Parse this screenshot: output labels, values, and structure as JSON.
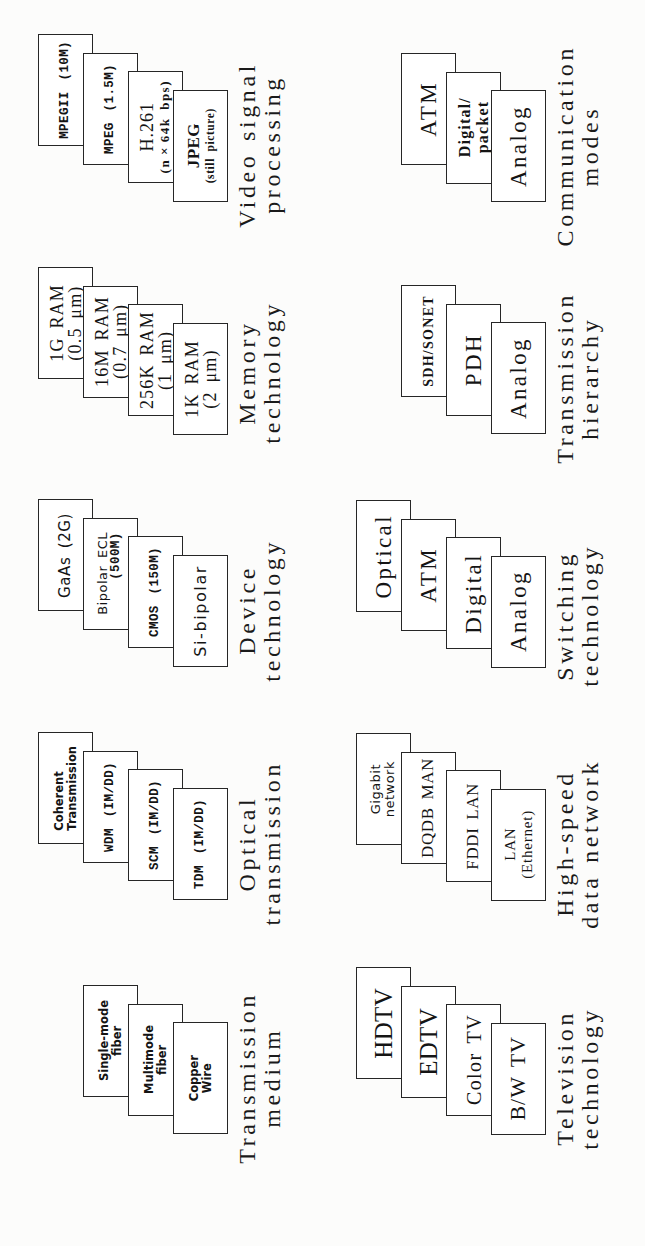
{
  "diagram": {
    "groups": [
      {
        "title": [
          "Transmission",
          "medium"
        ],
        "items": [
          [
            "Copper",
            "Wire"
          ],
          [
            "Multimode",
            "fiber"
          ],
          [
            "Single-mode",
            "fiber"
          ]
        ]
      },
      {
        "title": [
          "Optical",
          "transmission"
        ],
        "items": [
          [
            "TDM (IM/DD)"
          ],
          [
            "SCM (IM/DD)"
          ],
          [
            "WDM (IM/DD)"
          ],
          [
            "Coherent",
            "Transmission"
          ]
        ]
      },
      {
        "title": [
          "Device",
          "technology"
        ],
        "items": [
          [
            "Si-bipolar"
          ],
          [
            "CMOS (150M)"
          ],
          [
            "Bipolar ECL",
            "(500M)"
          ],
          [
            "GaAs (2G)"
          ]
        ]
      },
      {
        "title": [
          "Memory",
          "technology"
        ],
        "items": [
          [
            "1K RAM",
            "(2 μm)"
          ],
          [
            "256K RAM",
            "(1 μm)"
          ],
          [
            "16M RAM",
            "(0.7 μm)"
          ],
          [
            "1G RAM",
            "(0.5 μm)"
          ]
        ]
      },
      {
        "title": [
          "Video signal",
          "processing"
        ],
        "items": [
          [
            "JPEG",
            "(still picture)"
          ],
          [
            "H.261",
            "(n×64k bps)"
          ],
          [
            "MPEG (1.5M)"
          ],
          [
            "MPEGII (10M)"
          ]
        ]
      },
      {
        "title": [
          "Television",
          "technology"
        ],
        "items": [
          [
            "B/W TV"
          ],
          [
            "Color TV"
          ],
          [
            "EDTV"
          ],
          [
            "HDTV"
          ]
        ]
      },
      {
        "title": [
          "High-speed",
          "data network"
        ],
        "items": [
          [
            "LAN",
            "(Ethernet)"
          ],
          [
            "FDDI LAN"
          ],
          [
            "DQDB MAN"
          ],
          [
            "Gigabit",
            "network"
          ]
        ]
      },
      {
        "title": [
          "Switching",
          "technology"
        ],
        "items": [
          [
            "Analog"
          ],
          [
            "Digital"
          ],
          [
            "ATM"
          ],
          [
            "Optical"
          ]
        ]
      },
      {
        "title": [
          "Transmission",
          "hierarchy"
        ],
        "items": [
          [
            "Analog"
          ],
          [
            "PDH"
          ],
          [
            "SDH/SONET"
          ]
        ]
      },
      {
        "title": [
          "Communication",
          "modes"
        ],
        "items": [
          [
            "Analog"
          ],
          [
            "Digital/",
            "packet"
          ],
          [
            "ATM"
          ]
        ]
      }
    ]
  }
}
